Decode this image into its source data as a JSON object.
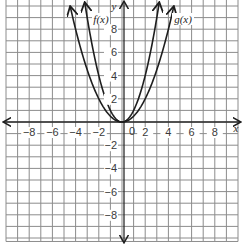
{
  "chart_data": {
    "type": "line",
    "title": "",
    "xlabel": "x",
    "ylabel": "y",
    "xlim": [
      -10,
      10
    ],
    "ylim": [
      -10,
      10
    ],
    "grid": true,
    "x_ticks": [
      -8,
      -6,
      -4,
      -2,
      2,
      4,
      6,
      8
    ],
    "x_tick_labels": [
      "−8",
      "−6",
      "−4",
      "−2",
      "2",
      "4",
      "6",
      "8"
    ],
    "y_ticks": [
      8,
      6,
      4,
      2,
      -2,
      -4,
      -6,
      -8
    ],
    "y_tick_labels": [
      "8",
      "6",
      "4",
      "2",
      "−2",
      "−4",
      "−6",
      "−8"
    ],
    "origin_label": "0",
    "series": [
      {
        "name": "f(x)",
        "label": "f(x)",
        "expression": "x^2",
        "coefficient": 1,
        "x_range": [
          -3.2,
          3.2
        ]
      },
      {
        "name": "g(x)",
        "label": "g(x)",
        "expression": "0.5x^2",
        "coefficient": 0.5,
        "x_range": [
          -4.45,
          4.45
        ]
      }
    ]
  }
}
